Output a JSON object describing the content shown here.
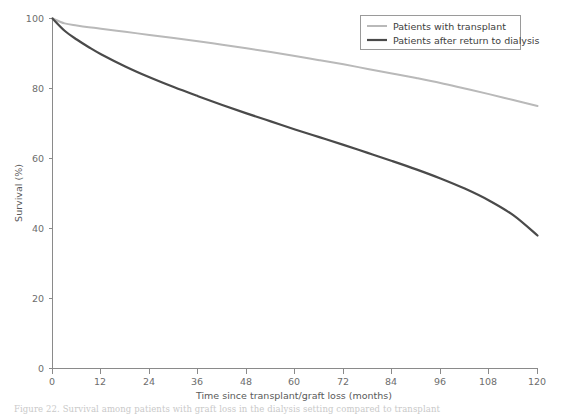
{
  "chart_data": {
    "type": "line",
    "title": "",
    "xlabel": "Time since transplant/graft loss (months)",
    "ylabel": "Survival (%)",
    "xlim": [
      0,
      120
    ],
    "ylim": [
      0,
      100
    ],
    "xticks": [
      0,
      12,
      24,
      36,
      48,
      60,
      72,
      84,
      96,
      108,
      120
    ],
    "xtick_labels": [
      "0",
      "12",
      "24",
      "36",
      "48",
      "60",
      "72",
      "84",
      "96",
      "108",
      "120"
    ],
    "yticks": [
      0,
      20,
      40,
      60,
      80,
      100
    ],
    "ytick_labels": [
      "0",
      "20",
      "40",
      "60",
      "80",
      "100"
    ],
    "grid": false,
    "legend_position": "top-right",
    "x": [
      0,
      3,
      6,
      9,
      12,
      18,
      24,
      30,
      36,
      42,
      48,
      54,
      60,
      66,
      72,
      78,
      84,
      90,
      96,
      102,
      108,
      114,
      120
    ],
    "series": [
      {
        "name": "Patients with transplant",
        "color": "#b9b9b9",
        "values": [
          100,
          98.6,
          98.0,
          97.5,
          97.1,
          96.2,
          95.3,
          94.4,
          93.5,
          92.5,
          91.5,
          90.4,
          89.3,
          88.1,
          86.9,
          85.6,
          84.3,
          83.0,
          81.6,
          80.0,
          78.4,
          76.7,
          75.0
        ]
      },
      {
        "name": "Patients after return to dialysis",
        "color": "#4a4a4a",
        "values": [
          100,
          96.5,
          94.0,
          91.8,
          89.8,
          86.3,
          83.2,
          80.4,
          77.8,
          75.3,
          72.9,
          70.6,
          68.3,
          66.1,
          63.9,
          61.6,
          59.3,
          56.9,
          54.3,
          51.4,
          48.0,
          43.8,
          38.0
        ]
      }
    ]
  },
  "legend": {
    "entries": [
      {
        "label": "Patients with transplant",
        "color": "#b9b9b9"
      },
      {
        "label": "Patients after return to dialysis",
        "color": "#4a4a4a"
      }
    ]
  },
  "caption": {
    "text": "Figure 22. Survival among patients with graft loss in the dialysis setting compared to transplant"
  }
}
